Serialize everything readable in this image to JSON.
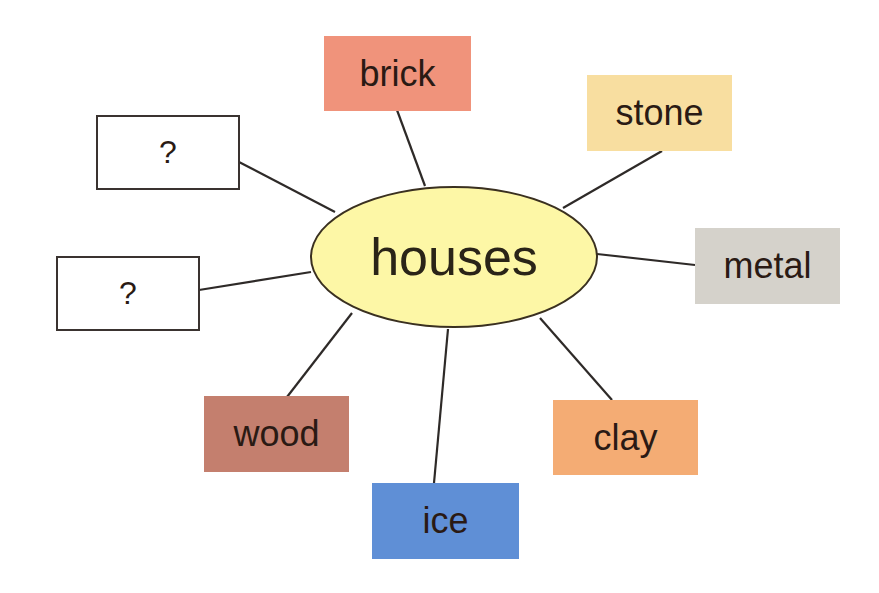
{
  "diagram": {
    "type": "mind-map",
    "center": {
      "label": "houses",
      "color": "#fdf7a6"
    },
    "nodes": [
      {
        "id": "brick",
        "label": "brick",
        "color": "#f0937b"
      },
      {
        "id": "stone",
        "label": "stone",
        "color": "#f8dea0"
      },
      {
        "id": "metal",
        "label": "metal",
        "color": "#d5d2cb"
      },
      {
        "id": "clay",
        "label": "clay",
        "color": "#f4ac74"
      },
      {
        "id": "ice",
        "label": "ice",
        "color": "#5f8fd6"
      },
      {
        "id": "wood",
        "label": "wood",
        "color": "#c47f6e"
      },
      {
        "id": "unknown1",
        "label": "?",
        "color": "#ffffff"
      },
      {
        "id": "unknown2",
        "label": "?",
        "color": "#ffffff"
      }
    ]
  }
}
